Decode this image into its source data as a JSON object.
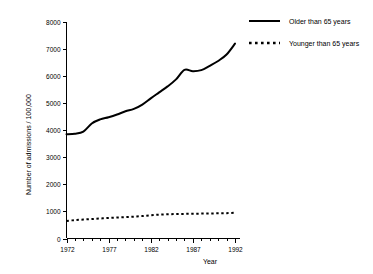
{
  "chart_data": {
    "type": "line",
    "title": "",
    "xlabel": "Year",
    "ylabel": "Number of admissions / 100,000",
    "xlim": [
      1972,
      1992
    ],
    "ylim": [
      0,
      8000
    ],
    "grid": false,
    "legend_position": "upper-right",
    "x_ticks_major": [
      "1972",
      "1977",
      "1982",
      "1987",
      "1992"
    ],
    "x_ticks_major_values": [
      1972,
      1977,
      1982,
      1987,
      1992
    ],
    "x_ticks_minor_values": [
      1973,
      1974,
      1975,
      1976,
      1978,
      1979,
      1980,
      1981,
      1983,
      1984,
      1985,
      1986,
      1988,
      1989,
      1990,
      1991
    ],
    "y_ticks": [
      "0",
      "1000",
      "2000",
      "3000",
      "4000",
      "5000",
      "6000",
      "7000",
      "8000"
    ],
    "y_tick_values": [
      0,
      1000,
      2000,
      3000,
      4000,
      5000,
      6000,
      7000,
      8000
    ],
    "x": [
      1972,
      1973,
      1974,
      1975,
      1976,
      1977,
      1978,
      1979,
      1980,
      1981,
      1982,
      1983,
      1984,
      1985,
      1986,
      1987,
      1988,
      1989,
      1990,
      1991,
      1992
    ],
    "series": [
      {
        "name": "Older than 65 years",
        "style": "solid",
        "color": "#000000",
        "values": [
          3850,
          3870,
          3950,
          4250,
          4400,
          4480,
          4580,
          4700,
          4790,
          4950,
          5180,
          5400,
          5620,
          5880,
          6230,
          6180,
          6220,
          6380,
          6560,
          6800,
          7200
        ]
      },
      {
        "name": "Younger than 65 years",
        "style": "dotted",
        "color": "#000000",
        "values": [
          650,
          680,
          700,
          720,
          740,
          760,
          775,
          790,
          805,
          830,
          860,
          880,
          895,
          905,
          910,
          915,
          920,
          925,
          930,
          935,
          950
        ]
      }
    ]
  },
  "legend": {
    "items": [
      {
        "label": "Older than 65 years",
        "style": "solid"
      },
      {
        "label": "Younger than 65 years",
        "style": "dotted"
      }
    ]
  }
}
